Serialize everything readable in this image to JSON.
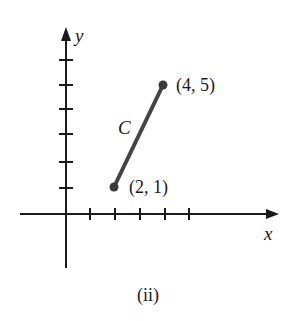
{
  "figure": {
    "caption": "(ii)",
    "axes": {
      "x_label": "x",
      "y_label": "y",
      "x_ticks": [
        1,
        2,
        3,
        4,
        5
      ],
      "y_ticks": [
        1,
        2,
        3,
        4,
        5,
        6
      ]
    },
    "curve": {
      "label": "C",
      "type": "line-segment",
      "start": {
        "x": 2,
        "y": 1,
        "label": "(2, 1)"
      },
      "end": {
        "x": 4,
        "y": 5,
        "label": "(4, 5)"
      }
    },
    "colors": {
      "axis": "#1a1a1a",
      "segment": "#444444",
      "point": "#3a3a3a"
    }
  }
}
